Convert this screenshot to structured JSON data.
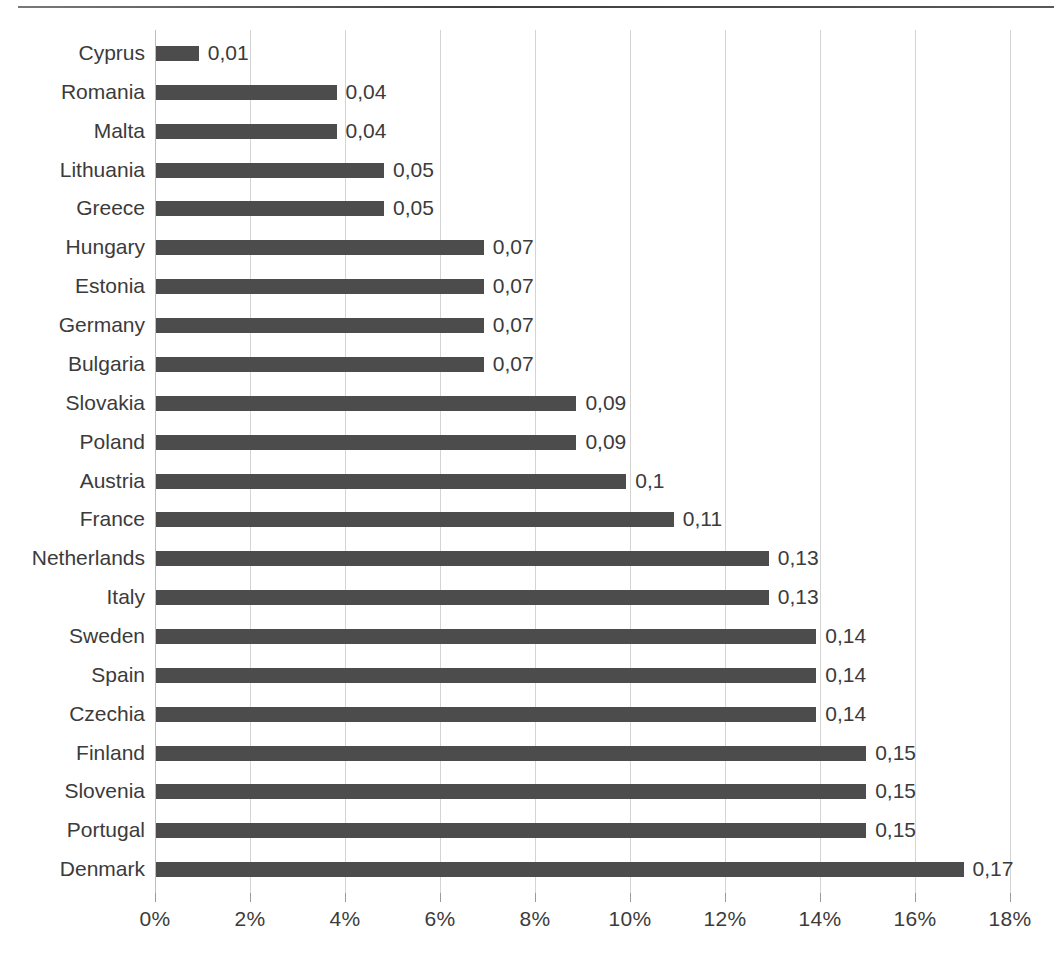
{
  "chart_data": {
    "type": "bar",
    "orientation": "horizontal",
    "title": "",
    "subtitle": "",
    "xlabel": "",
    "ylabel": "",
    "xlim": [
      0,
      18
    ],
    "grid": true,
    "legend": false,
    "legend_position": "none",
    "x_tick_labels": [
      "0%",
      "2%",
      "4%",
      "6%",
      "8%",
      "10%",
      "12%",
      "14%",
      "16%",
      "18%"
    ],
    "x_tick_values": [
      0,
      2,
      4,
      6,
      8,
      10,
      12,
      14,
      16,
      18
    ],
    "value_label_format": "comma-decimal",
    "bar_color": "#4c4c4c",
    "gridline_color": "#d4d4d4",
    "text_color": "#3b3b3b",
    "background_color": "#ffffff",
    "categories": [
      "Cyprus",
      "Romania",
      "Malta",
      "Lithuania",
      "Greece",
      "Hungary",
      "Estonia",
      "Germany",
      "Bulgaria",
      "Slovakia",
      "Poland",
      "Austria",
      "France",
      "Netherlands",
      "Italy",
      "Sweden",
      "Spain",
      "Czechia",
      "Finland",
      "Slovenia",
      "Portugal",
      "Denmark"
    ],
    "values": [
      0.01,
      0.04,
      0.04,
      0.05,
      0.05,
      0.07,
      0.07,
      0.07,
      0.07,
      0.09,
      0.09,
      0.1,
      0.11,
      0.13,
      0.13,
      0.14,
      0.14,
      0.14,
      0.15,
      0.15,
      0.15,
      0.17
    ],
    "value_labels": [
      "0,01",
      "0,04",
      "0,04",
      "0,05",
      "0,05",
      "0,07",
      "0,07",
      "0,07",
      "0,07",
      "0,09",
      "0,09",
      "0,1",
      "0,11",
      "0,13",
      "0,13",
      "0,14",
      "0,14",
      "0,14",
      "0,15",
      "0,15",
      "0,15",
      "0,17"
    ],
    "bar_percent_widths": [
      0.9,
      3.8,
      3.8,
      4.8,
      4.8,
      6.9,
      6.9,
      6.9,
      6.9,
      8.85,
      8.85,
      9.9,
      10.9,
      12.9,
      12.9,
      13.9,
      13.9,
      13.9,
      14.95,
      14.95,
      14.95,
      17.0
    ]
  }
}
